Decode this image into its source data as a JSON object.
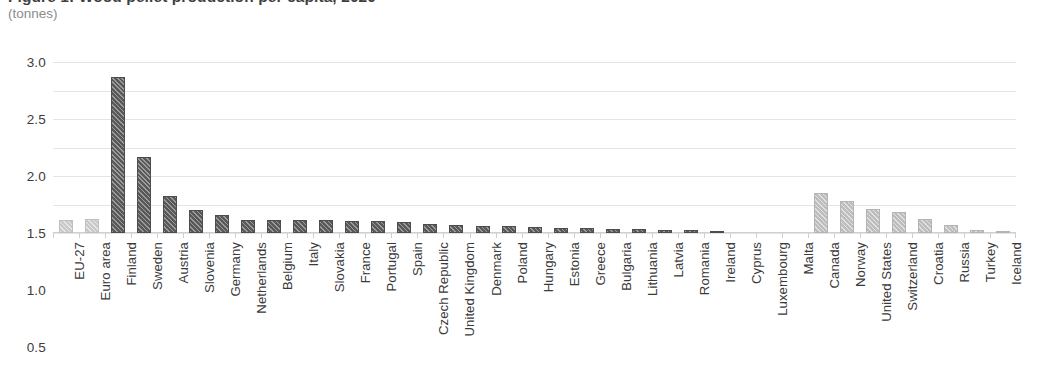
{
  "header": {
    "title": "Figure 1: Wood pellet production per capita, 2020",
    "subtitle": "(tonnes)"
  },
  "chart_data": {
    "type": "bar",
    "title": "Figure 1: Wood pellet production per capita, 2020",
    "subtitle": "(tonnes)",
    "xlabel": "",
    "ylabel": "(tonnes)",
    "ylim": [
      0.0,
      3.0
    ],
    "yticks": [
      "0.0",
      "0.5",
      "1.0",
      "1.5",
      "2.0",
      "2.5",
      "3.0"
    ],
    "ytick_values": [
      0.0,
      0.5,
      1.0,
      1.5,
      2.0,
      2.5,
      3.0
    ],
    "grid": true,
    "legend": "none",
    "categories": [
      "EU-27",
      "Euro area",
      "Finland",
      "Sweden",
      "Austria",
      "Slovenia",
      "Germany",
      "Netherlands",
      "Belgium",
      "Italy",
      "Slovakia",
      "France",
      "Portugal",
      "Spain",
      "Czech Republic",
      "United Kingdom",
      "Denmark",
      "Poland",
      "Hungary",
      "Estonia",
      "Greece",
      "Bulgaria",
      "Lithuania",
      "Latvia",
      "Romania",
      "Ireland",
      "Cyprus",
      "Luxembourg",
      "Malta",
      "Canada",
      "Norway",
      "United States",
      "Switzerland",
      "Croatia",
      "Russia",
      "Turkey",
      "Iceland"
    ],
    "values": [
      0.22,
      0.25,
      2.73,
      1.33,
      0.65,
      0.4,
      0.31,
      0.23,
      0.23,
      0.22,
      0.22,
      0.21,
      0.21,
      0.2,
      0.16,
      0.14,
      0.13,
      0.12,
      0.1,
      0.09,
      0.08,
      0.07,
      0.07,
      0.06,
      0.05,
      0.03,
      0.02,
      0.01,
      0.0,
      0.7,
      0.56,
      0.42,
      0.36,
      0.25,
      0.14,
      0.06,
      0.03
    ],
    "groups": [
      "aggregate",
      "aggregate",
      "eu",
      "eu",
      "eu",
      "eu",
      "eu",
      "eu",
      "eu",
      "eu",
      "eu",
      "eu",
      "eu",
      "eu",
      "eu",
      "eu",
      "eu",
      "eu",
      "eu",
      "eu",
      "eu",
      "eu",
      "eu",
      "eu",
      "eu",
      "eu",
      "eu",
      "eu",
      "eu",
      "non-eu",
      "non-eu",
      "non-eu",
      "non-eu",
      "non-eu",
      "non-eu",
      "non-eu",
      "non-eu"
    ],
    "colors": {
      "aggregate": "#c9c9c9",
      "eu": "#595959",
      "non-eu": "#bdbdbd",
      "gridline": "#e4e4e4",
      "text": "#3a3a3a",
      "subtitle": "#8c8c8c"
    }
  }
}
